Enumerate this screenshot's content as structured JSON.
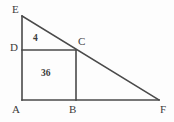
{
  "figure": {
    "type": "geometry-diagram",
    "canvas": {
      "width": 174,
      "height": 122,
      "background": "#fdfdfd"
    },
    "stroke": {
      "color": "#4a4a4a",
      "width": 1.6
    },
    "text_color": "#3b3b3b",
    "points": {
      "E": {
        "x": 22,
        "y": 16,
        "label": "E"
      },
      "D": {
        "x": 22,
        "y": 50,
        "label": "D"
      },
      "A": {
        "x": 22,
        "y": 100,
        "label": "A"
      },
      "B": {
        "x": 76,
        "y": 100,
        "label": "B"
      },
      "C": {
        "x": 76,
        "y": 50,
        "label": "C"
      },
      "F": {
        "x": 159,
        "y": 100,
        "label": "F"
      }
    },
    "vertex_labels": [
      {
        "name": "E",
        "text": "E"
      },
      {
        "name": "D",
        "text": "D"
      },
      {
        "name": "A",
        "text": "A"
      },
      {
        "name": "B",
        "text": "B"
      },
      {
        "name": "C",
        "text": "C"
      },
      {
        "name": "F",
        "text": "F"
      }
    ],
    "area_labels": [
      {
        "name": "triangle-EDC-area",
        "text": "4"
      },
      {
        "name": "square-ABCD-area",
        "text": "36"
      }
    ],
    "segments": [
      {
        "name": "EA",
        "from": "E",
        "to": "A"
      },
      {
        "name": "EF",
        "from": "E",
        "to": "F"
      },
      {
        "name": "AF",
        "from": "A",
        "to": "F"
      },
      {
        "name": "DC",
        "from": "D",
        "to": "C"
      },
      {
        "name": "BC",
        "from": "B",
        "to": "C"
      }
    ]
  }
}
